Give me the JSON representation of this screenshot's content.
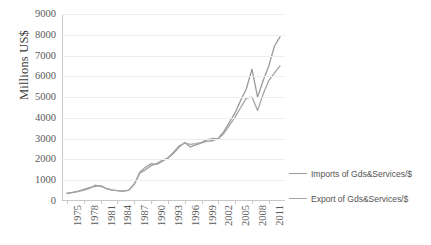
{
  "chart_data": {
    "type": "line",
    "title": "",
    "xlabel": "",
    "ylabel": "Millions US$",
    "ylim": [
      0,
      9000
    ],
    "ytick_labels": [
      "9000",
      "8000",
      "7000",
      "6000",
      "5000",
      "4000",
      "3000",
      "2000",
      "1000",
      "0"
    ],
    "ytick_values": [
      9000,
      8000,
      7000,
      6000,
      5000,
      4000,
      3000,
      2000,
      1000,
      0
    ],
    "xtick_labels": [
      "1975",
      "1978",
      "1981",
      "1984",
      "1987",
      "1990",
      "1993",
      "1996",
      "1999",
      "2002",
      "2005",
      "2008",
      "2011"
    ],
    "grid": true,
    "legend_position": "right",
    "x": [
      1975,
      1976,
      1977,
      1978,
      1979,
      1980,
      1981,
      1982,
      1983,
      1984,
      1985,
      1986,
      1987,
      1988,
      1989,
      1990,
      1991,
      1992,
      1993,
      1994,
      1995,
      1996,
      1997,
      1998,
      1999,
      2000,
      2001,
      2002,
      2003,
      2004,
      2005,
      2006,
      2007,
      2008,
      2009,
      2010,
      2011,
      2012,
      2013
    ],
    "series": [
      {
        "name": "Imports of Gds&Services/$",
        "color": "#9a9a9a",
        "values": [
          370,
          420,
          470,
          560,
          640,
          700,
          740,
          600,
          520,
          500,
          480,
          510,
          800,
          1350,
          1500,
          1700,
          1800,
          1960,
          2060,
          2300,
          2600,
          2820,
          2600,
          2700,
          2800,
          2880,
          2900,
          3020,
          3350,
          3800,
          4250,
          4850,
          5400,
          6350,
          5000,
          5800,
          6500,
          7450,
          7900
        ]
      },
      {
        "name": "Export of Gds&Services/$",
        "color": "#a5a5a5",
        "values": [
          380,
          400,
          450,
          520,
          600,
          760,
          700,
          610,
          530,
          500,
          470,
          520,
          820,
          1400,
          1620,
          1800,
          1760,
          1900,
          2080,
          2350,
          2650,
          2780,
          2720,
          2760,
          2820,
          2950,
          3010,
          3000,
          3250,
          3650,
          4050,
          4500,
          4950,
          5000,
          4350,
          5150,
          5800,
          6150,
          6500
        ]
      }
    ]
  },
  "legend": {
    "items": [
      {
        "label": "Imports of Gds&Services/$"
      },
      {
        "label": "Export of Gds&Services/$"
      }
    ]
  }
}
